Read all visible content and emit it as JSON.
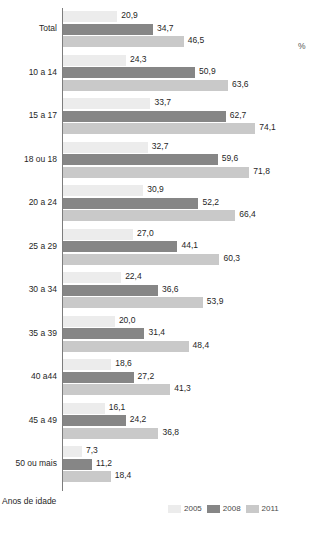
{
  "header": {
    "clipped_title": "",
    "unit_label": "%"
  },
  "axis_caption": "Anos de idade",
  "legend": {
    "position": "bottom-right",
    "items": [
      {
        "label": "2005",
        "color": "#ececec"
      },
      {
        "label": "2008",
        "color": "#868686"
      },
      {
        "label": "2011",
        "color": "#c9c9c9"
      }
    ]
  },
  "chart_data": {
    "type": "bar",
    "orientation": "horizontal",
    "title": "",
    "xlabel": "%",
    "ylabel": "Anos de idade",
    "grid": false,
    "legend_position": "bottom-right",
    "xlim": [
      0,
      80
    ],
    "categories": [
      "Total",
      "10 a 14",
      "15 a 17",
      "18 ou 18",
      "20 a 24",
      "25 a 29",
      "30 a 34",
      "35 a 39",
      "40 a44",
      "45 a 49",
      "50 ou mais"
    ],
    "series": [
      {
        "name": "2005",
        "color": "#ececec",
        "values": [
          20.9,
          24.3,
          33.7,
          32.7,
          30.9,
          27.0,
          22.4,
          20.0,
          18.6,
          16.1,
          7.3
        ],
        "labels": [
          "20,9",
          "24,3",
          "33,7",
          "32,7",
          "30,9",
          "27,0",
          "22,4",
          "20,0",
          "18,6",
          "16,1",
          "7,3"
        ]
      },
      {
        "name": "2008",
        "color": "#868686",
        "values": [
          34.7,
          50.9,
          62.7,
          59.6,
          52.2,
          44.1,
          36.6,
          31.4,
          27.2,
          24.2,
          11.2
        ],
        "labels": [
          "34,7",
          "50,9",
          "62,7",
          "59,6",
          "52,2",
          "44,1",
          "36,6",
          "31,4",
          "27,2",
          "24,2",
          "11,2"
        ]
      },
      {
        "name": "2011",
        "color": "#c9c9c9",
        "values": [
          46.5,
          63.6,
          74.1,
          71.8,
          66.4,
          60.3,
          53.9,
          48.4,
          41.3,
          36.8,
          18.4
        ],
        "labels": [
          "46,5",
          "63,6",
          "74,1",
          "71,8",
          "66,4",
          "60,3",
          "53,9",
          "48,4",
          "41,3",
          "36,8",
          "18,4"
        ]
      }
    ]
  }
}
